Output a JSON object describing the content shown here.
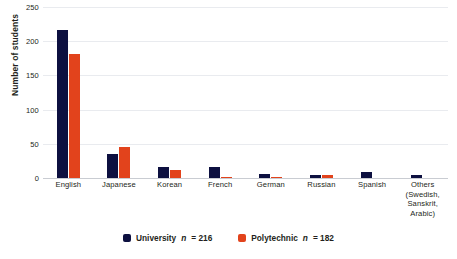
{
  "chart_data": {
    "type": "bar",
    "title": "",
    "xlabel": "",
    "ylabel": "Number of students",
    "ylim": [
      0,
      250
    ],
    "ytick_values": [
      0,
      50,
      100,
      150,
      200,
      250
    ],
    "ytick_labels": [
      "0",
      "50",
      "100",
      "150",
      "200",
      "250"
    ],
    "grid": true,
    "legend_position": "bottom-center",
    "categories": [
      "English",
      "Japanese",
      "Korean",
      "French",
      "German",
      "Russian",
      "Spanish",
      "Others (Swedish, Sanskrit, Arabic)"
    ],
    "category_labels": [
      {
        "line1": "English",
        "line2": "",
        "line3": "",
        "line4": ""
      },
      {
        "line1": "Japanese",
        "line2": "",
        "line3": "",
        "line4": ""
      },
      {
        "line1": "Korean",
        "line2": "",
        "line3": "",
        "line4": ""
      },
      {
        "line1": "French",
        "line2": "",
        "line3": "",
        "line4": ""
      },
      {
        "line1": "German",
        "line2": "",
        "line3": "",
        "line4": ""
      },
      {
        "line1": "Russian",
        "line2": "",
        "line3": "",
        "line4": ""
      },
      {
        "line1": "Spanish",
        "line2": "",
        "line3": "",
        "line4": ""
      },
      {
        "line1": "Others",
        "line2": "(Swedish,",
        "line3": "Sanskrit,",
        "line4": "Arabic)"
      }
    ],
    "series": [
      {
        "name": "University",
        "n": 216,
        "legend_label": "University",
        "legend_n": "n",
        "legend_value": "= 216",
        "color": "#0d1040",
        "values": [
          216,
          35,
          16,
          16,
          6,
          5,
          9,
          4
        ]
      },
      {
        "name": "Polytechnic",
        "n": 182,
        "legend_label": "Polytechnic",
        "legend_n": "n",
        "legend_value": "= 182",
        "color": "#e2431c",
        "values": [
          182,
          45,
          11,
          2,
          1,
          5,
          0,
          0
        ]
      }
    ]
  },
  "colors": {
    "university": "#0d1040",
    "polytechnic": "#e2431c",
    "gridline": "#e9ebef",
    "baseline": "#c9ccd2",
    "text": "#231f20",
    "background": "#ffffff"
  }
}
